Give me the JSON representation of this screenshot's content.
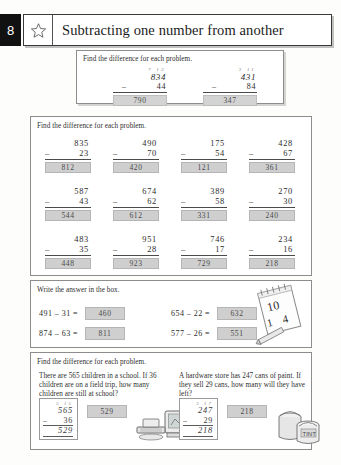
{
  "header": {
    "page_number": "8",
    "star_icon": "star-outline-icon",
    "title": "Subtracting one number from another"
  },
  "example": {
    "instruction": "Find the difference for each problem.",
    "problems": [
      {
        "carry": "7 12",
        "minuend": "834",
        "operator": "–",
        "subtrahend": "44",
        "answer": "790"
      },
      {
        "carry": "3 11",
        "minuend": "431",
        "operator": "–",
        "subtrahend": "84",
        "answer": "347"
      }
    ]
  },
  "grid": {
    "instruction": "Find the difference for each problem.",
    "rows": [
      [
        {
          "minuend": "835",
          "operator": "–",
          "subtrahend": "23",
          "answer": "812"
        },
        {
          "minuend": "490",
          "operator": "–",
          "subtrahend": "70",
          "answer": "420"
        },
        {
          "minuend": "175",
          "operator": "–",
          "subtrahend": "54",
          "answer": "121"
        },
        {
          "minuend": "428",
          "operator": "–",
          "subtrahend": "67",
          "answer": "361"
        }
      ],
      [
        {
          "minuend": "587",
          "operator": "–",
          "subtrahend": "43",
          "answer": "544"
        },
        {
          "minuend": "674",
          "operator": "–",
          "subtrahend": "62",
          "answer": "612"
        },
        {
          "minuend": "389",
          "operator": "–",
          "subtrahend": "58",
          "answer": "331"
        },
        {
          "minuend": "270",
          "operator": "–",
          "subtrahend": "30",
          "answer": "240"
        }
      ],
      [
        {
          "minuend": "483",
          "operator": "–",
          "subtrahend": "35",
          "answer": "448"
        },
        {
          "minuend": "951",
          "operator": "–",
          "subtrahend": "28",
          "answer": "923"
        },
        {
          "minuend": "746",
          "operator": "–",
          "subtrahend": "17",
          "answer": "729"
        },
        {
          "minuend": "234",
          "operator": "–",
          "subtrahend": "16",
          "answer": "218"
        }
      ]
    ]
  },
  "write_section": {
    "instruction": "Write the answer in the box.",
    "equations": [
      {
        "expr": "491 – 31 =",
        "answer": "460"
      },
      {
        "expr": "654 – 22 =",
        "answer": "632"
      },
      {
        "expr": "874 – 63 =",
        "answer": "811"
      },
      {
        "expr": "577 – 26 =",
        "answer": "551"
      }
    ],
    "doodle": "notepad-pencil-icon"
  },
  "word_section": {
    "instruction": "Find the difference for each problem.",
    "problems": [
      {
        "text": "There are 565 children in a school. If 36 children are on a field trip, how many children are still at school?",
        "carry": "5 15",
        "minuend": "565",
        "operator": "–",
        "subtrahend": "36",
        "result": "529",
        "answer": "529",
        "doodle": "computer-icon"
      },
      {
        "text": "A hardware store has 247 cans of paint. If they sell 29 cans, how many will they have left?",
        "carry": "3 17",
        "minuend": "247",
        "operator": "–",
        "subtrahend": "29",
        "result": "218",
        "answer": "218",
        "doodle": "paint-cans-icon"
      }
    ]
  },
  "colors": {
    "answer_fill": "#cfcfcf",
    "page_badge": "#111111",
    "ink": "#2b2b2b"
  }
}
